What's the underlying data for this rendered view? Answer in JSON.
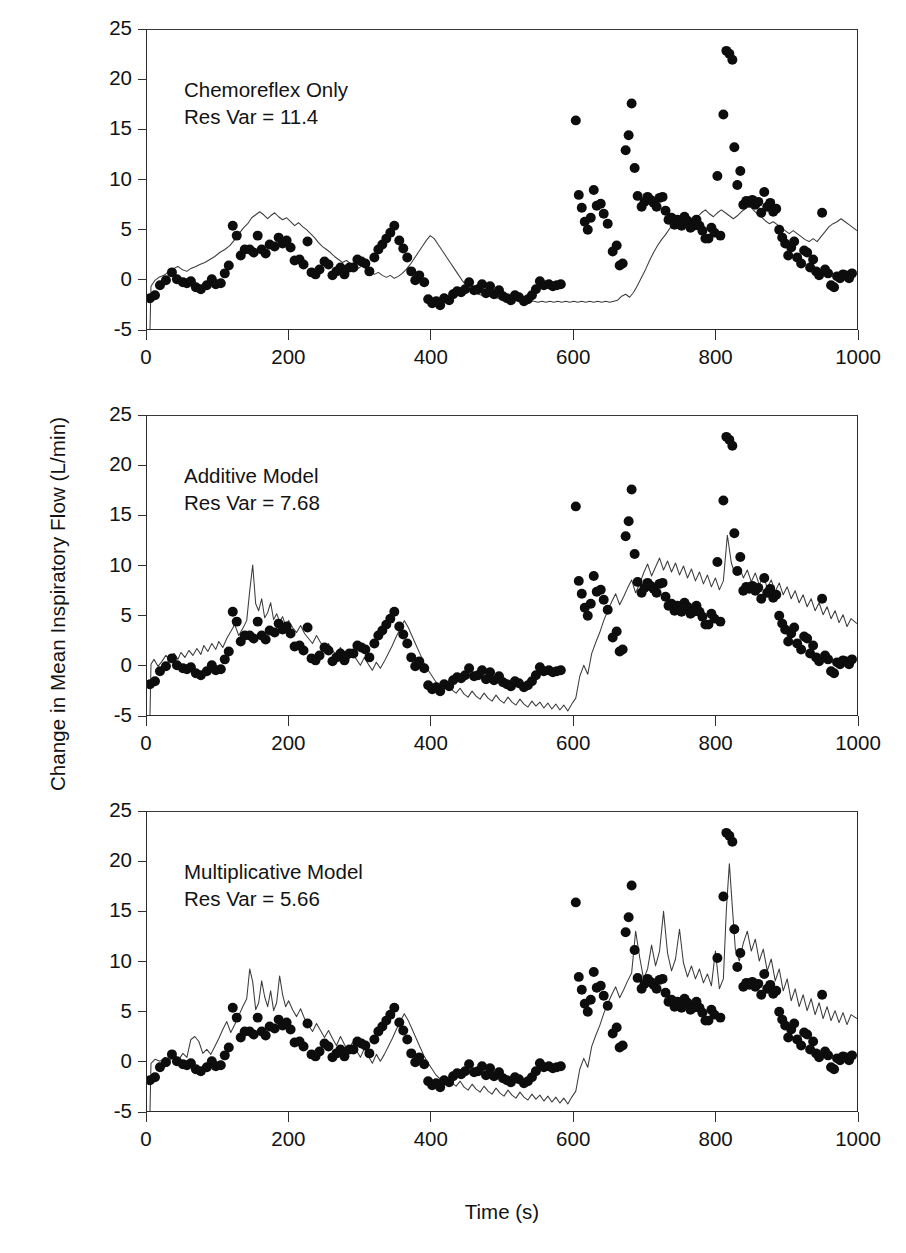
{
  "figure": {
    "axis_title_y": "Change in Mean Inspiratory Flow (L/min)",
    "axis_title_x": "Time (s)"
  },
  "chart_data": {
    "type": "scatter",
    "title": "",
    "xlabel": "Time (s)",
    "ylabel": "Change in Mean Inspiratory Flow (L/min)",
    "xlim": [
      0,
      1000
    ],
    "ylim": [
      -5,
      25
    ],
    "xticks": [
      0,
      200,
      400,
      600,
      800,
      1000
    ],
    "yticks": [
      -5,
      0,
      5,
      10,
      15,
      20,
      25
    ],
    "grid": false,
    "legend": "none",
    "marker_color": "#0d0d0d",
    "line_color": "#3a3a3a",
    "panel_layout": "3 stacked panels sharing x and y axes",
    "panels": [
      {
        "id": "chemoreflex-only",
        "annotation_line1": "Chemoreflex Only",
        "annotation_line2": "Res Var = 11.4",
        "res_var": 11.4,
        "series": [
          {
            "name": "Measured data",
            "style": "scatter",
            "x": [
              5,
              12,
              20,
              28,
              36,
              44,
              52,
              60,
              68,
              76,
              84,
              92,
              100,
              108,
              116,
              124,
              132,
              140,
              148,
              156,
              164,
              172,
              180,
              188,
              196,
              204,
              212,
              220,
              228,
              236,
              244,
              252,
              260,
              268,
              276,
              284,
              292,
              300,
              308,
              316,
              324,
              332,
              340,
              348,
              356,
              364,
              372,
              380,
              388,
              396,
              404,
              412,
              420,
              428,
              436,
              444,
              452,
              460,
              468,
              476,
              484,
              492,
              500,
              508,
              516,
              524,
              532,
              540,
              548,
              556,
              564,
              572,
              580,
              588,
              596,
              604,
              612,
              620,
              628,
              636,
              644,
              652,
              660,
              668,
              676,
              684,
              692,
              700,
              708,
              716,
              724,
              732,
              740,
              748,
              756,
              764,
              772,
              780,
              788,
              796,
              804,
              812,
              820,
              828,
              836,
              844,
              852,
              860,
              868,
              876,
              884,
              892,
              900,
              908,
              916,
              924,
              932,
              940,
              948,
              956,
              964,
              972,
              980,
              988
            ],
            "y": [
              -3.9,
              -3.6,
              -2.6,
              -2.1,
              -1.3,
              -2.0,
              -2.3,
              -2.4,
              -2.2,
              -2.8,
              -3.0,
              -2.6,
              -2.0,
              -2.5,
              -2.4,
              -1.4,
              -0.6,
              3.4,
              2.4,
              0.4,
              1.0,
              1.0,
              0.7,
              2.4,
              1.0,
              0.6,
              1.5,
              1.3,
              2.2,
              1.6,
              1.9,
              1.2,
              -0.1,
              0.0,
              -0.5,
              1.8,
              -1.2,
              -1.4,
              -0.9,
              -0.2,
              -0.5,
              -1.6,
              -1.2,
              -0.8,
              -1.5,
              -0.8,
              -0.8,
              0.0,
              -0.2,
              -0.4,
              -1.2,
              0.2,
              1.0,
              1.5,
              2.1,
              2.7,
              3.4,
              1.9,
              1.1,
              0.2,
              -1.2,
              -2.1,
              -1.6,
              -2.3,
              -4.0,
              -4.4,
              -4.2,
              -4.6,
              -3.9,
              -4.1,
              -3.5,
              -3.2,
              -3.3,
              -3.0,
              -2.3,
              -3.1,
              -3.0,
              -2.5,
              -3.4,
              -2.7,
              -3.5,
              -3.1,
              -3.7,
              -3.9,
              -4.1,
              -3.6,
              -3.8,
              -4.2,
              -4.0,
              -3.6,
              -3.8,
              -4.4,
              -3.4,
              -3.0,
              -3.7,
              -4.1,
              -3.8,
              -4.3,
              -3.2,
              -3.0,
              -2.9,
              -3.2,
              -3.0,
              -3.5,
              -3.3,
              -3.0,
              -3.4,
              -3.0,
              -3.6,
              -3.2,
              -2.9,
              -3.2,
              -3.5,
              -3.1,
              -3.3,
              -2.8,
              -3.1,
              -3.3,
              -3.6,
              -3.2,
              -3.0,
              -3.4,
              -3.2,
              -3.1
            ],
            "note": "Baseline segment 0-560 s; full series continues with elevated/high-variance segment 560-1000 s listed in overflow arrays"
          },
          {
            "name": "Model prediction",
            "style": "line",
            "description": "Thin continuous trace following the slow trend of the data; poorest agreement of the three panels, under-predicting the large transient excursions after 560 s"
          }
        ]
      },
      {
        "id": "additive-model",
        "annotation_line1": "Additive Model",
        "annotation_line2": "Res Var = 7.68",
        "res_var": 7.68,
        "series": [
          {
            "name": "Measured data",
            "style": "scatter",
            "description": "Identical measured scatter as panel 1"
          },
          {
            "name": "Model prediction",
            "style": "line",
            "description": "Thin trace with more high-frequency detail; tracks the 800 s transient up to about 12 L/min"
          }
        ]
      },
      {
        "id": "multiplicative-model",
        "annotation_line1": "Multiplicative Model",
        "annotation_line2": "Res Var = 5.66",
        "res_var": 5.66,
        "series": [
          {
            "name": "Measured data",
            "style": "scatter",
            "description": "Identical measured scatter as panel 1"
          },
          {
            "name": "Model prediction",
            "style": "line",
            "description": "Thin trace with largest dynamic range; best agreement, reaching about 12.5 L/min near 805 s"
          }
        ]
      }
    ],
    "scatter_xy": [
      [
        5,
        -3.9
      ],
      [
        12,
        -3.6
      ],
      [
        20,
        -2.6
      ],
      [
        28,
        -2.1
      ],
      [
        36,
        -1.3
      ],
      [
        44,
        -2.0
      ],
      [
        52,
        -2.3
      ],
      [
        58,
        -2.4
      ],
      [
        64,
        -2.2
      ],
      [
        70,
        -2.8
      ],
      [
        78,
        -3.0
      ],
      [
        86,
        -2.6
      ],
      [
        94,
        -2.0
      ],
      [
        100,
        -2.5
      ],
      [
        106,
        -2.4
      ],
      [
        112,
        -1.4
      ],
      [
        118,
        -0.6
      ],
      [
        124,
        3.4
      ],
      [
        130,
        2.4
      ],
      [
        136,
        0.4
      ],
      [
        142,
        1.0
      ],
      [
        148,
        1.0
      ],
      [
        154,
        0.7
      ],
      [
        160,
        2.4
      ],
      [
        166,
        1.0
      ],
      [
        172,
        0.6
      ],
      [
        178,
        1.5
      ],
      [
        184,
        1.3
      ],
      [
        190,
        2.2
      ],
      [
        196,
        1.6
      ],
      [
        202,
        1.9
      ],
      [
        208,
        1.2
      ],
      [
        214,
        -0.1
      ],
      [
        220,
        0.0
      ],
      [
        226,
        -0.5
      ],
      [
        232,
        1.8
      ],
      [
        238,
        -1.2
      ],
      [
        244,
        -1.4
      ],
      [
        250,
        -0.9
      ],
      [
        256,
        -0.2
      ],
      [
        262,
        -0.5
      ],
      [
        268,
        -1.6
      ],
      [
        274,
        -1.2
      ],
      [
        280,
        -0.8
      ],
      [
        286,
        -1.5
      ],
      [
        292,
        -0.8
      ],
      [
        298,
        -0.8
      ],
      [
        304,
        0.0
      ],
      [
        310,
        -0.2
      ],
      [
        316,
        -0.4
      ],
      [
        322,
        -1.2
      ],
      [
        328,
        0.2
      ],
      [
        334,
        1.0
      ],
      [
        340,
        1.5
      ],
      [
        346,
        2.1
      ],
      [
        352,
        2.7
      ],
      [
        358,
        3.4
      ],
      [
        364,
        1.9
      ],
      [
        370,
        1.1
      ],
      [
        376,
        0.2
      ],
      [
        382,
        -1.2
      ],
      [
        388,
        -2.1
      ],
      [
        394,
        -1.6
      ],
      [
        400,
        -2.3
      ],
      [
        406,
        -4.0
      ],
      [
        412,
        -4.4
      ],
      [
        418,
        -4.2
      ],
      [
        424,
        -4.6
      ],
      [
        430,
        -3.9
      ],
      [
        436,
        -4.1
      ],
      [
        442,
        -3.5
      ],
      [
        448,
        -3.2
      ],
      [
        454,
        -3.3
      ],
      [
        460,
        -3.0
      ],
      [
        466,
        -2.3
      ],
      [
        472,
        -3.1
      ],
      [
        478,
        -3.0
      ],
      [
        484,
        -2.5
      ],
      [
        490,
        -3.4
      ],
      [
        496,
        -2.7
      ],
      [
        502,
        -3.5
      ],
      [
        508,
        -3.1
      ],
      [
        514,
        -3.7
      ],
      [
        520,
        -3.9
      ],
      [
        526,
        -4.1
      ],
      [
        532,
        -3.6
      ],
      [
        538,
        -3.8
      ],
      [
        544,
        -4.2
      ],
      [
        550,
        -4.0
      ],
      [
        556,
        -3.6
      ],
      [
        562,
        -3.0
      ],
      [
        568,
        -2.2
      ],
      [
        574,
        -2.6
      ],
      [
        580,
        -2.5
      ],
      [
        586,
        -2.7
      ],
      [
        592,
        -2.6
      ],
      [
        598,
        -2.5
      ],
      [
        604,
        12.0
      ],
      [
        608,
        4.5
      ],
      [
        612,
        3.2
      ],
      [
        616,
        1.8
      ],
      [
        620,
        1.0
      ],
      [
        624,
        2.2
      ],
      [
        628,
        5.0
      ],
      [
        632,
        3.4
      ],
      [
        636,
        3.6
      ],
      [
        640,
        2.6
      ],
      [
        646,
        1.6
      ],
      [
        652,
        -1.2
      ],
      [
        658,
        -0.6
      ],
      [
        662,
        -2.6
      ],
      [
        666,
        -2.4
      ],
      [
        670,
        9.0
      ],
      [
        674,
        10.5
      ],
      [
        678,
        13.7
      ],
      [
        682,
        7.2
      ],
      [
        686,
        4.4
      ],
      [
        690,
        3.3
      ],
      [
        694,
        3.8
      ],
      [
        698,
        4.3
      ],
      [
        702,
        4.0
      ],
      [
        706,
        3.7
      ],
      [
        710,
        3.3
      ],
      [
        714,
        4.2
      ],
      [
        718,
        4.3
      ],
      [
        722,
        2.9
      ],
      [
        726,
        2.0
      ],
      [
        730,
        2.2
      ],
      [
        734,
        1.5
      ],
      [
        738,
        2.0
      ],
      [
        742,
        1.4
      ],
      [
        746,
        2.3
      ],
      [
        750,
        1.9
      ],
      [
        754,
        1.2
      ],
      [
        758,
        1.4
      ],
      [
        762,
        2.1
      ],
      [
        766,
        1.4
      ],
      [
        770,
        0.9
      ],
      [
        774,
        0.1
      ],
      [
        778,
        0.1
      ],
      [
        782,
        1.2
      ],
      [
        786,
        0.7
      ],
      [
        790,
        6.4
      ],
      [
        794,
        0.4
      ],
      [
        798,
        12.6
      ],
      [
        802,
        19.0
      ],
      [
        806,
        18.7
      ],
      [
        810,
        18.1
      ],
      [
        812,
        9.3
      ],
      [
        816,
        5.5
      ],
      [
        820,
        7.0
      ],
      [
        824,
        3.6
      ],
      [
        828,
        4.0
      ],
      [
        832,
        3.8
      ],
      [
        836,
        4.1
      ],
      [
        840,
        3.6
      ],
      [
        844,
        3.9
      ],
      [
        848,
        2.7
      ],
      [
        852,
        4.7
      ],
      [
        856,
        3.1
      ],
      [
        860,
        3.5
      ],
      [
        864,
        2.6
      ],
      [
        868,
        2.9
      ],
      [
        872,
        0.8
      ],
      [
        876,
        0.0
      ],
      [
        880,
        -0.6
      ],
      [
        884,
        -1.8
      ],
      [
        888,
        -1.0
      ],
      [
        892,
        -0.4
      ],
      [
        896,
        -2.0
      ],
      [
        900,
        -2.6
      ],
      [
        904,
        -1.3
      ],
      [
        908,
        -1.5
      ],
      [
        912,
        -3.0
      ],
      [
        916,
        -2.2
      ],
      [
        920,
        -3.4
      ],
      [
        924,
        -3.8
      ],
      [
        928,
        2.6
      ],
      [
        932,
        -3.0
      ],
      [
        936,
        -3.4
      ],
      [
        940,
        -4.6
      ],
      [
        944,
        -4.8
      ],
      [
        948,
        -3.7
      ],
      [
        952,
        -3.9
      ],
      [
        956,
        -3.5
      ],
      [
        960,
        -3.6
      ],
      [
        964,
        -3.9
      ],
      [
        968,
        -3.4
      ]
    ]
  }
}
